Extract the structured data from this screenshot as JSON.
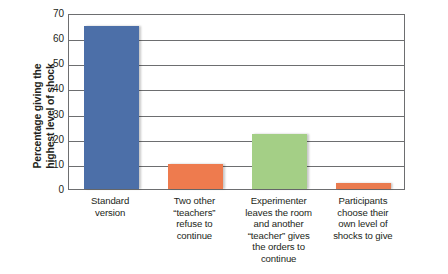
{
  "chart_data": {
    "type": "bar",
    "title": "",
    "subtitle": "",
    "xlabel": "",
    "ylabel": "Percentage giving the\nhighest level of shock",
    "ylim": [
      0,
      70
    ],
    "yticks": [
      70,
      60,
      50,
      40,
      30,
      20,
      10,
      0
    ],
    "ytick_labels": [
      "70",
      "60",
      "50",
      "40",
      "30",
      "20",
      "10",
      "0"
    ],
    "grid": true,
    "legend": false,
    "legend_position": "none",
    "categories": [
      "Standard\nversion",
      "Two other\n“teachers”\nrefuse to\ncontinue",
      "Experimenter\nleaves the room\nand another\n“teacher” gives\nthe orders to\ncontinue",
      "Participants\nchoose their\nown level of\nshocks to give"
    ],
    "values": [
      65,
      10,
      22,
      2.5
    ],
    "bar_colors": [
      "#4c6fa8",
      "#ee7b4e",
      "#a4cf86",
      "#ea7b4f"
    ],
    "annotations": []
  },
  "colors": {
    "axis": "#6d6e70",
    "grid": "#6d6e70",
    "text": "#231f20",
    "background": "#ffffff",
    "bar_blue": "#4c6fa8",
    "bar_orange": "#ee7b4e",
    "bar_green": "#a4cf86"
  }
}
